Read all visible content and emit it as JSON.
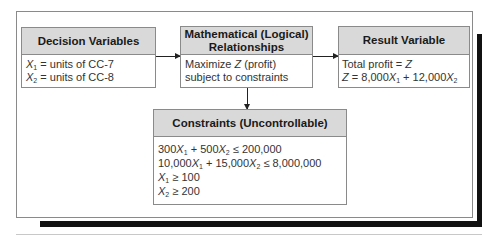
{
  "diagram": {
    "decision_variables": {
      "title": "Decision Variables",
      "lines": [
        {
          "var": "X",
          "sub": "1",
          "text": " = units of CC-7"
        },
        {
          "var": "X",
          "sub": "2",
          "text": " = units of CC-8"
        }
      ]
    },
    "relationships": {
      "title_line1": "Mathematical (Logical)",
      "title_line2": "Relationships",
      "line1_pre": "Maximize ",
      "line1_var": "Z",
      "line1_post": " (profit)",
      "line2": "subject to constraints"
    },
    "result_variable": {
      "title": "Result Variable",
      "line1_pre": "Total profit = ",
      "line1_var": "Z",
      "line2": {
        "z": "Z",
        "eq": " = 8,000",
        "x1": "X",
        "x1_sub": "1",
        "plus": " + 12,000",
        "x2": "X",
        "x2_sub": "2"
      }
    },
    "constraints": {
      "title": "Constraints (Uncontrollable)",
      "c1": {
        "a": "300",
        "x1": "X",
        "s1": "1",
        "b": " + 500",
        "x2": "X",
        "s2": "2",
        "rhs": " ≤ 200,000"
      },
      "c2": {
        "a": "10,000",
        "x1": "X",
        "s1": "1",
        "b": " + 15,000",
        "x2": "X",
        "s2": "2",
        "rhs": " ≤ 8,000,000"
      },
      "c3": {
        "x": "X",
        "s": "1",
        "rhs": " ≥ 100"
      },
      "c4": {
        "x": "X",
        "s": "2",
        "rhs": " ≥ 200"
      }
    },
    "colors": {
      "header_fill": "#d9d9d9",
      "border": "#8a8a8a",
      "shadow": "#111111"
    }
  }
}
